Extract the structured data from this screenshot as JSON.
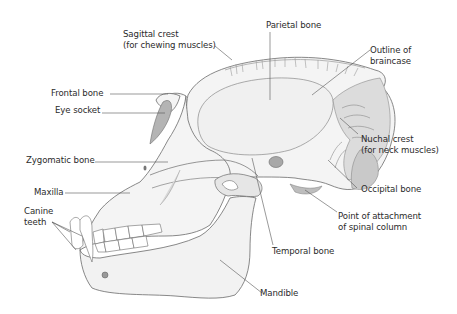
{
  "diagram": {
    "colors": {
      "outline": "#6b6b6b",
      "bone_fill": "#f4f4f4",
      "shade": "#d6d6d6",
      "dark_shade": "#b8b8b8",
      "leader_line": "#555555",
      "text": "#2b2b2b"
    },
    "labels": {
      "sagittal_crest": {
        "line1": "Sagittal crest",
        "line2": "(for chewing muscles)"
      },
      "parietal_bone": "Parietal bone",
      "outline_braincase": {
        "line1": "Outline of",
        "line2": "braincase"
      },
      "frontal_bone": "Frontal bone",
      "eye_socket": "Eye socket",
      "nuchal_crest": {
        "line1": "Nuchal crest",
        "line2": "(for neck muscles)"
      },
      "zygomatic_bone": "Zygomatic bone",
      "maxilla": "Maxilla",
      "canine_teeth": {
        "line1": "Canine",
        "line2": "teeth"
      },
      "occipital_bone": "Occipital bone",
      "spinal_attachment": {
        "line1": "Point of attachment",
        "line2": "of spinal column"
      },
      "temporal_bone": "Temporal bone",
      "mandible": "Mandible"
    }
  }
}
